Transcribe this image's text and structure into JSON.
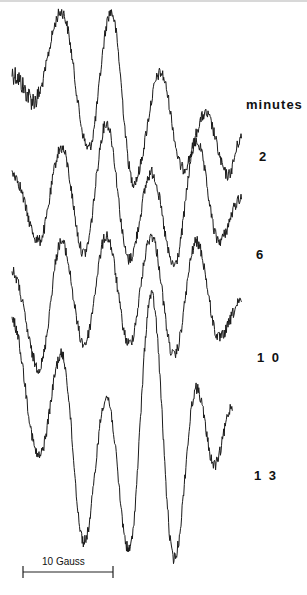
{
  "chart_data": {
    "type": "line",
    "title": "",
    "xlabel": "Magnetic field",
    "ylabel": "",
    "legend_title": "minutes",
    "scale_bar": {
      "label": "10 Gauss",
      "gauss": 10
    },
    "x_range_gauss": [
      0,
      26
    ],
    "series": [
      {
        "name": "2",
        "points": [
          [
            0,
            0.1
          ],
          [
            2.5,
            -0.3
          ],
          [
            5.5,
            1.0
          ],
          [
            8.5,
            -1.0
          ],
          [
            11,
            1.0
          ],
          [
            13.5,
            -1.5
          ],
          [
            16.5,
            0.1
          ],
          [
            19,
            -1.3
          ],
          [
            21.5,
            -0.5
          ],
          [
            24,
            -1.4
          ],
          [
            25.5,
            -0.85
          ]
        ]
      },
      {
        "name": "6",
        "points": [
          [
            0,
            0.2
          ],
          [
            3,
            -0.9
          ],
          [
            5.5,
            0.6
          ],
          [
            8,
            -1.1
          ],
          [
            10.5,
            1.0
          ],
          [
            13,
            -1.2
          ],
          [
            15.5,
            0.2
          ],
          [
            18,
            -1.3
          ],
          [
            20.5,
            0.7
          ],
          [
            23,
            -0.9
          ],
          [
            25.5,
            -0.2
          ]
        ]
      },
      {
        "name": "10",
        "points": [
          [
            0,
            0.3
          ],
          [
            3,
            -1.3
          ],
          [
            5.5,
            0.8
          ],
          [
            8,
            -0.9
          ],
          [
            10.5,
            0.9
          ],
          [
            13,
            -0.9
          ],
          [
            15.5,
            0.9
          ],
          [
            18,
            -1.1
          ],
          [
            20.5,
            0.8
          ],
          [
            23,
            -0.8
          ],
          [
            25.5,
            -0.2
          ]
        ]
      },
      {
        "name": "13",
        "points": [
          [
            0,
            0.7
          ],
          [
            3,
            -0.9
          ],
          [
            5.5,
            0.3
          ],
          [
            8,
            -1.9
          ],
          [
            10.5,
            -0.2
          ],
          [
            13,
            -2.0
          ],
          [
            15.5,
            1.0
          ],
          [
            18,
            -2.1
          ],
          [
            20.5,
            -0.1
          ],
          [
            22.5,
            -1.0
          ],
          [
            24.5,
            -0.3
          ]
        ]
      }
    ],
    "series_labels": [
      "2",
      "6",
      "10",
      "13"
    ]
  },
  "labels": {
    "unit": "minutes",
    "trace_2": "2",
    "trace_6": "6",
    "trace_10": "1 0",
    "trace_13": "1 3",
    "scale": "10 Gauss"
  }
}
